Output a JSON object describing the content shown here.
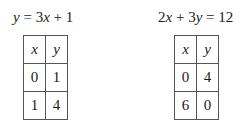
{
  "problems": [
    {
      "equation_parts": [
        "y",
        " = 3",
        "x",
        " + 1"
      ],
      "table": {
        "headers": [
          "x",
          "y"
        ],
        "rows": [
          [
            "0",
            "1"
          ],
          [
            "1",
            "4"
          ]
        ]
      }
    },
    {
      "equation_parts": [
        "2",
        "x",
        " + 3",
        "y",
        " = 12"
      ],
      "table": {
        "headers": [
          "x",
          "y"
        ],
        "rows": [
          [
            "0",
            "4"
          ],
          [
            "6",
            "0"
          ]
        ]
      }
    }
  ]
}
